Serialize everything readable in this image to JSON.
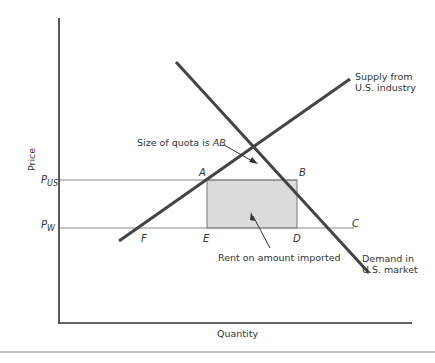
{
  "diagram": {
    "axes": {
      "y_label": "Price",
      "x_label": "Quantity",
      "price_levels": [
        {
          "label": "P",
          "subscript": "US",
          "name": "US price"
        },
        {
          "label": "P",
          "subscript": "W",
          "name": "World price"
        }
      ]
    },
    "curves": {
      "supply": {
        "label_line1": "Supply from",
        "label_line2": "U.S. industry"
      },
      "demand": {
        "label_line1": "Demand in",
        "label_line2": "U.S. market"
      }
    },
    "points": {
      "A": "A",
      "B": "B",
      "C": "C",
      "D": "D",
      "E": "E",
      "F": "F"
    },
    "annotations": {
      "quota": {
        "text": "Size of quota is ",
        "italic_part": "AB"
      },
      "rent": {
        "text": "Rent on amount imported"
      }
    },
    "colors": {
      "curve": "#444444",
      "axis": "#222222",
      "price_line": "#777777",
      "rent_fill": "#dcdcdc",
      "text": "#333333"
    }
  }
}
